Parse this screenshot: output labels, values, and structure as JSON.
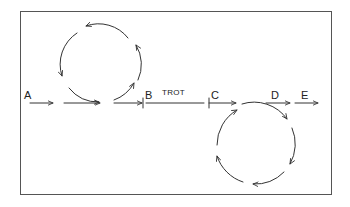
{
  "diagram": {
    "labels": {
      "a": "A",
      "b": "B",
      "trot": "TROT",
      "c": "C",
      "d": "D",
      "e": "E"
    },
    "colors": {
      "stroke": "#333333",
      "frame": "#555555",
      "background": "#ffffff"
    },
    "cycles": [
      {
        "name": "upper-cycle",
        "position": "between A and B",
        "direction": "counterclockwise",
        "arrow_count": 4
      },
      {
        "name": "lower-cycle",
        "position": "between C and D",
        "direction": "clockwise",
        "arrow_count": 4
      }
    ]
  }
}
